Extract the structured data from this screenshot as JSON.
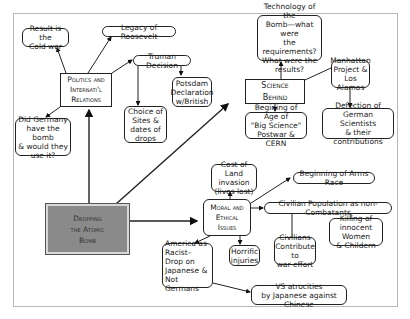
{
  "diagram": {
    "title": "Dropping the Atomic Bomb",
    "nodes": {
      "main": "Dropping\nthe Atomic\nBomb",
      "politics": "Politics and\nInternati'l\nRelations",
      "cold_war": "Result is the\nCold war",
      "roosevelt": "Legacy of Roosevelt",
      "truman": "Truman Decision",
      "potsdam": "Potsdam\nDeclaration\nw/British",
      "sites": "Choice of\nSites &\ndates of\ndrops",
      "germany": "Did Germany\nhave the bomb\n& would they\nuse it?",
      "science": "Science Behind",
      "technology": "Technology of the\nBomb—what were\nthe requirements?\nWhat were the\nresults?",
      "manhattan": "Manhattan\nProject &\nLos Alamos",
      "big_science": "Begining of Age of\n\"Big Science\"\nPostwar & CERN",
      "defection": "Defection of\nGerman Scientists\n& their contributions",
      "moral": "Moral and\nEthical\nIssues",
      "land_invasion": "Cost of Land\ninvasion\n(lives lost)",
      "arms_race": "Beginning of Arms Race",
      "civilian": "Civilian Population as non-Combatants",
      "killing": "Killing of\ninnocent Women\n& Childern",
      "civilians_contribute": "Civilians\nContribute to\nwar effort",
      "horrific": "Horrific\ninjuries",
      "racist": "America as\nRacist–\nDrop on\nJapanese &\nNot Germans",
      "atrocities": "VS atrocities\nby Japanese against Chinese"
    }
  }
}
